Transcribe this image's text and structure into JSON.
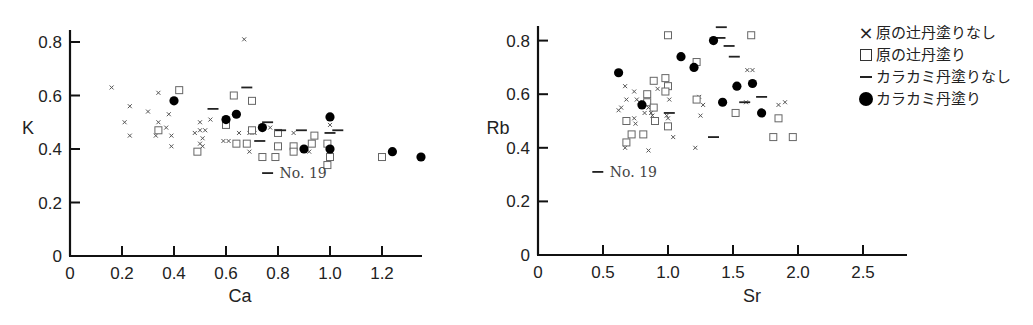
{
  "legend": {
    "items": [
      {
        "symbol": "cross",
        "label": "原の辻丹塗りなし"
      },
      {
        "symbol": "square",
        "label": "原の辻丹塗り"
      },
      {
        "symbol": "dash",
        "label": "カラカミ丹塗りなし"
      },
      {
        "symbol": "filled-circle",
        "label": "カラカミ丹塗り"
      }
    ]
  },
  "chart_data": [
    {
      "type": "scatter",
      "title": "",
      "xlabel": "Ca",
      "ylabel": "K",
      "xlim": [
        0,
        1.36
      ],
      "ylim": [
        0,
        0.85
      ],
      "xticks": [
        "0",
        "0.2",
        "0.4",
        "0.6",
        "0.8",
        "1.0",
        "1.2"
      ],
      "yticks": [
        "0",
        "0.2",
        "0.4",
        "0.6",
        "0.8"
      ],
      "grid": false,
      "annotations": [
        {
          "text": "No. 19",
          "x": 0.76,
          "y": 0.31
        }
      ],
      "series": [
        {
          "name": "原の辻丹塗りなし",
          "marker": "cross",
          "points": [
            [
              0.16,
              0.63
            ],
            [
              0.21,
              0.5
            ],
            [
              0.23,
              0.56
            ],
            [
              0.23,
              0.45
            ],
            [
              0.3,
              0.54
            ],
            [
              0.34,
              0.61
            ],
            [
              0.34,
              0.5
            ],
            [
              0.33,
              0.45
            ],
            [
              0.37,
              0.48
            ],
            [
              0.38,
              0.53
            ],
            [
              0.39,
              0.45
            ],
            [
              0.39,
              0.41
            ],
            [
              0.48,
              0.46
            ],
            [
              0.5,
              0.47
            ],
            [
              0.5,
              0.5
            ],
            [
              0.52,
              0.47
            ],
            [
              0.51,
              0.44
            ],
            [
              0.5,
              0.42
            ],
            [
              0.51,
              0.41
            ],
            [
              0.54,
              0.51
            ],
            [
              0.59,
              0.43
            ],
            [
              0.61,
              0.43
            ],
            [
              0.65,
              0.46
            ],
            [
              0.67,
              0.81
            ],
            [
              0.69,
              0.46
            ],
            [
              0.69,
              0.39
            ],
            [
              0.71,
              0.46
            ],
            [
              0.77,
              0.48
            ],
            [
              0.86,
              0.46
            ],
            [
              0.92,
              0.39
            ],
            [
              1.0,
              0.49
            ]
          ]
        },
        {
          "name": "原の辻丹塗り",
          "marker": "square",
          "points": [
            [
              0.42,
              0.62
            ],
            [
              0.34,
              0.47
            ],
            [
              0.49,
              0.39
            ],
            [
              0.6,
              0.49
            ],
            [
              0.63,
              0.6
            ],
            [
              0.64,
              0.42
            ],
            [
              0.68,
              0.42
            ],
            [
              0.7,
              0.58
            ],
            [
              0.7,
              0.47
            ],
            [
              0.74,
              0.37
            ],
            [
              0.79,
              0.37
            ],
            [
              0.8,
              0.46
            ],
            [
              0.8,
              0.41
            ],
            [
              0.86,
              0.41
            ],
            [
              0.86,
              0.39
            ],
            [
              0.93,
              0.42
            ],
            [
              0.94,
              0.45
            ],
            [
              0.99,
              0.42
            ],
            [
              1.0,
              0.37
            ],
            [
              0.99,
              0.34
            ],
            [
              1.2,
              0.37
            ]
          ]
        },
        {
          "name": "カラカミ丹塗りなし",
          "marker": "dash",
          "points": [
            [
              0.55,
              0.55
            ],
            [
              0.68,
              0.63
            ],
            [
              0.76,
              0.5
            ],
            [
              0.73,
              0.43
            ],
            [
              0.81,
              0.47
            ],
            [
              0.89,
              0.47
            ],
            [
              1.0,
              0.46
            ],
            [
              1.03,
              0.47
            ],
            [
              0.76,
              0.31
            ]
          ]
        },
        {
          "name": "カラカミ丹塗り",
          "marker": "filled-circle",
          "points": [
            [
              0.4,
              0.58
            ],
            [
              0.6,
              0.51
            ],
            [
              0.64,
              0.53
            ],
            [
              0.74,
              0.48
            ],
            [
              0.9,
              0.4
            ],
            [
              1.0,
              0.52
            ],
            [
              1.0,
              0.4
            ],
            [
              1.24,
              0.39
            ],
            [
              1.35,
              0.37
            ]
          ]
        }
      ]
    },
    {
      "type": "scatter",
      "title": "",
      "xlabel": "Sr",
      "ylabel": "Rb",
      "xlim": [
        0,
        2.84
      ],
      "ylim": [
        0,
        0.85
      ],
      "xticks": [
        "0",
        "0.5",
        "1.0",
        "1.5",
        "2.0",
        "2.5"
      ],
      "yticks": [
        "0",
        "0.2",
        "0.4",
        "0.6",
        "0.8"
      ],
      "grid": false,
      "annotations": [
        {
          "text": "No. 19",
          "x": 0.46,
          "y": 0.31
        }
      ],
      "series": [
        {
          "name": "原の辻丹塗りなし",
          "marker": "cross",
          "points": [
            [
              0.62,
              0.54
            ],
            [
              0.64,
              0.55
            ],
            [
              0.67,
              0.63
            ],
            [
              0.67,
              0.5
            ],
            [
              0.68,
              0.58
            ],
            [
              0.67,
              0.4
            ],
            [
              0.74,
              0.61
            ],
            [
              0.74,
              0.51
            ],
            [
              0.75,
              0.49
            ],
            [
              0.76,
              0.58
            ],
            [
              0.78,
              0.57
            ],
            [
              0.82,
              0.53
            ],
            [
              0.84,
              0.6
            ],
            [
              0.85,
              0.55
            ],
            [
              0.85,
              0.39
            ],
            [
              0.87,
              0.53
            ],
            [
              0.88,
              0.52
            ],
            [
              0.92,
              0.62
            ],
            [
              0.99,
              0.66
            ],
            [
              0.99,
              0.52
            ],
            [
              1.01,
              0.58
            ],
            [
              1.0,
              0.51
            ],
            [
              1.04,
              0.44
            ],
            [
              1.21,
              0.4
            ],
            [
              1.24,
              0.59
            ],
            [
              1.25,
              0.52
            ],
            [
              1.27,
              0.56
            ],
            [
              1.6,
              0.57
            ],
            [
              1.61,
              0.69
            ],
            [
              1.65,
              0.69
            ],
            [
              1.85,
              0.56
            ],
            [
              1.9,
              0.57
            ]
          ]
        },
        {
          "name": "原の辻丹塗り",
          "marker": "square",
          "points": [
            [
              1.0,
              0.82
            ],
            [
              1.64,
              0.82
            ],
            [
              1.22,
              0.72
            ],
            [
              0.89,
              0.65
            ],
            [
              0.98,
              0.66
            ],
            [
              1.0,
              0.63
            ],
            [
              0.98,
              0.61
            ],
            [
              0.84,
              0.6
            ],
            [
              0.84,
              0.57
            ],
            [
              0.89,
              0.55
            ],
            [
              1.22,
              0.58
            ],
            [
              0.68,
              0.5
            ],
            [
              0.9,
              0.5
            ],
            [
              1.0,
              0.48
            ],
            [
              0.72,
              0.45
            ],
            [
              0.81,
              0.45
            ],
            [
              0.68,
              0.42
            ],
            [
              1.52,
              0.53
            ],
            [
              1.85,
              0.51
            ],
            [
              1.81,
              0.44
            ],
            [
              1.96,
              0.44
            ]
          ]
        },
        {
          "name": "カラカミ丹塗りなし",
          "marker": "dash",
          "points": [
            [
              1.41,
              0.85
            ],
            [
              1.4,
              0.81
            ],
            [
              1.47,
              0.78
            ],
            [
              1.51,
              0.74
            ],
            [
              1.72,
              0.59
            ],
            [
              1.59,
              0.57
            ],
            [
              1.35,
              0.44
            ],
            [
              1.01,
              0.53
            ],
            [
              0.46,
              0.31
            ]
          ]
        },
        {
          "name": "カラカミ丹塗り",
          "marker": "filled-circle",
          "points": [
            [
              0.62,
              0.68
            ],
            [
              0.8,
              0.56
            ],
            [
              1.1,
              0.74
            ],
            [
              1.2,
              0.7
            ],
            [
              1.35,
              0.8
            ],
            [
              1.42,
              0.57
            ],
            [
              1.53,
              0.63
            ],
            [
              1.65,
              0.64
            ],
            [
              1.72,
              0.53
            ]
          ]
        }
      ]
    }
  ]
}
